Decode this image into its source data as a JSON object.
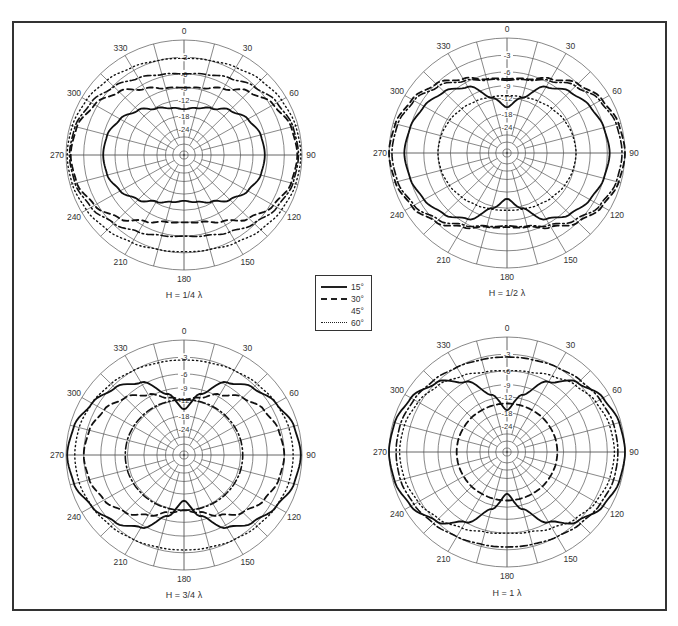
{
  "figure": {
    "legend": {
      "items": [
        {
          "label": "15°",
          "style": "solid"
        },
        {
          "label": "30°",
          "style": "dashed"
        },
        {
          "label": "45°",
          "style": "dashdot"
        },
        {
          "label": "60°",
          "style": "dotted"
        }
      ]
    },
    "panels": [
      {
        "caption": "H = 1/4 λ"
      },
      {
        "caption": "H = 1/2 λ"
      },
      {
        "caption": "H = 3/4 λ"
      },
      {
        "caption": "H = 1 λ"
      }
    ]
  },
  "chart_data": [
    {
      "type": "polar",
      "title": "H = 1/4 λ",
      "angle_labels": [
        "0",
        "30",
        "60",
        "90",
        "120",
        "150",
        "180",
        "210",
        "240",
        "270",
        "300",
        "330"
      ],
      "radial_labels_db": [
        "-3",
        "-6",
        "-9",
        "-12",
        "-18",
        "-24"
      ],
      "rlim_db": [
        -40,
        0
      ],
      "pattern_angles_deg": [
        0,
        15,
        30,
        45,
        60,
        75,
        90
      ],
      "symmetry": "mirror about 0-180 and 90-270 axes",
      "series": [
        {
          "name": "15°",
          "style": "solid",
          "db": [
            -15.5,
            -14.5,
            -12.5,
            -10,
            -8,
            -6.8,
            -6.5
          ]
        },
        {
          "name": "30°",
          "style": "dashed",
          "db": [
            -9,
            -8.6,
            -7,
            -4.5,
            -2.5,
            -1.2,
            -0.8
          ]
        },
        {
          "name": "45°",
          "style": "dashdot",
          "db": [
            -6,
            -5.6,
            -4.6,
            -3.2,
            -1.8,
            -0.9,
            -0.6
          ]
        },
        {
          "name": "60°",
          "style": "dotted",
          "db": [
            -3.2,
            -3,
            -2.4,
            -1.6,
            -0.9,
            -0.4,
            -0.2
          ]
        }
      ]
    },
    {
      "type": "polar",
      "title": "H = 1/2 λ",
      "angle_labels": [
        "0",
        "30",
        "60",
        "90",
        "120",
        "150",
        "180",
        "210",
        "240",
        "270",
        "300",
        "330"
      ],
      "radial_labels_db": [
        "-3",
        "-6",
        "-9",
        "-12",
        "-18",
        "-24"
      ],
      "rlim_db": [
        -40,
        0
      ],
      "pattern_angles_deg": [
        0,
        15,
        30,
        45,
        60,
        75,
        90
      ],
      "symmetry": "mirror about 0-180 and 90-270 axes",
      "series": [
        {
          "name": "15°",
          "style": "solid",
          "db": [
            -15.5,
            -11.5,
            -7,
            -5,
            -3.8,
            -3,
            -2.6
          ]
        },
        {
          "name": "30°",
          "style": "dashed",
          "db": [
            -7.5,
            -7,
            -5.2,
            -3,
            -1.4,
            -0.4,
            0
          ]
        },
        {
          "name": "45°",
          "style": "dashdot",
          "db": [
            -7.8,
            -7.2,
            -5.6,
            -3.6,
            -1.8,
            -0.8,
            -0.5
          ]
        },
        {
          "name": "60°",
          "style": "dotted",
          "db": [
            -11.5,
            -11.3,
            -10.8,
            -10.2,
            -9.6,
            -9.2,
            -9
          ]
        }
      ]
    },
    {
      "type": "polar",
      "title": "H = 3/4 λ",
      "angle_labels": [
        "0",
        "30",
        "60",
        "90",
        "120",
        "150",
        "180",
        "210",
        "240",
        "270",
        "300",
        "330"
      ],
      "radial_labels_db": [
        "-3",
        "-6",
        "-9",
        "-12",
        "-18",
        "-24"
      ],
      "rlim_db": [
        -40,
        0
      ],
      "pattern_angles_deg": [
        0,
        15,
        30,
        45,
        60,
        75,
        90
      ],
      "symmetry": "mirror about 0-180 and 90-270 axes",
      "series": [
        {
          "name": "15°",
          "style": "solid",
          "db": [
            -15.5,
            -10,
            -5.5,
            -3.5,
            -2,
            -0.7,
            -0.2
          ]
        },
        {
          "name": "30°",
          "style": "dashed",
          "db": [
            -12,
            -11,
            -8.5,
            -6,
            -4.4,
            -3.4,
            -3
          ]
        },
        {
          "name": "45°",
          "style": "dashdot",
          "db": [
            -12,
            -11.9,
            -11.8,
            -11.7,
            -11.6,
            -11.5,
            -11.5
          ]
        },
        {
          "name": "60°",
          "style": "dotted",
          "db": [
            -3.5,
            -3.4,
            -3,
            -2.5,
            -2,
            -1.6,
            -1.5
          ]
        }
      ]
    },
    {
      "type": "polar",
      "title": "H = 1 λ",
      "angle_labels": [
        "0",
        "30",
        "60",
        "90",
        "120",
        "150",
        "180",
        "210",
        "240",
        "270",
        "300",
        "330"
      ],
      "radial_labels_db": [
        "-3",
        "-6",
        "-9",
        "-12",
        "-18",
        "-24"
      ],
      "rlim_db": [
        -40,
        0
      ],
      "pattern_angles_deg": [
        0,
        15,
        30,
        45,
        60,
        75,
        90
      ],
      "symmetry": "mirror about 0-180 and 90-270 axes",
      "series": [
        {
          "name": "15°",
          "style": "solid",
          "db": [
            -17,
            -11,
            -6,
            -3,
            -1.2,
            -0.3,
            0
          ]
        },
        {
          "name": "30°",
          "style": "dashed",
          "db": [
            -14.5,
            -14.5,
            -14.5,
            -14.4,
            -14.4,
            -14.3,
            -14.3
          ]
        },
        {
          "name": "45°",
          "style": "dashdot",
          "db": [
            -3.5,
            -3.4,
            -3,
            -2.4,
            -1.8,
            -1.3,
            -1.2
          ]
        },
        {
          "name": "60°",
          "style": "dotted",
          "db": [
            -6,
            -5.7,
            -4.8,
            -3.6,
            -2.6,
            -2,
            -1.8
          ]
        }
      ]
    }
  ]
}
